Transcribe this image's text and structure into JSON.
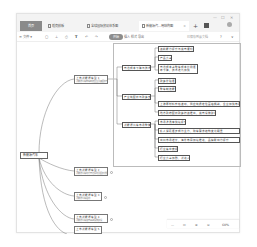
{
  "window": {
    "controls": [
      "—",
      "☐",
      "✕"
    ]
  },
  "tabs": [
    {
      "label": "首页",
      "active": false
    },
    {
      "label": "稻壳模板",
      "active": false
    },
    {
      "label": "全球国际贸易体系图",
      "active": false
    },
    {
      "label": "新能源汽...用结构图",
      "active": true,
      "close": "×"
    }
  ],
  "tab_add": "+",
  "toolbar": {
    "file_menu": "≡ 文件 ▾",
    "icons": [
      "save-icon",
      "upload-icon",
      "print-icon",
      "format-painter-icon",
      "undo-icon",
      "redo-icon"
    ],
    "icon_glyphs": [
      "▢",
      "⊥",
      "⎙",
      "🖌",
      "↶",
      "↷"
    ],
    "badge": "开始",
    "title_hint": "插入 样式 导出",
    "save_status": "已保存到云文档",
    "help": "?",
    "expand": "∨"
  },
  "mindmap": {
    "root": "新能源汽车",
    "level1": [
      {
        "label": "上市新能源车型 1",
        "sub": "新能源汽车整车制造企业及其配套产业链情况"
      },
      {
        "label": "上市新能源车型 2",
        "sub": "新能源汽车动力电池系统及配套发展情况"
      },
      {
        "label": "上市新能源车型 3",
        "sub": "新能源汽车驱动"
      },
      {
        "label": "上市新能源车型 4",
        "sub": "新能源汽车充电基础设施建设"
      },
      {
        "label": "上市新能源车型 5",
        "sub": "新能源汽车售后"
      }
    ],
    "level2": [
      {
        "label": "电池成本下降与技术进步"
      },
      {
        "label": "产业链配套与政策支持"
      },
      {
        "label": "新能源汽车市场整体发展"
      }
    ],
    "level3": [
      {
        "label": "续航能力提升与充电便利性需求"
      },
      {
        "label": "产品竞争力"
      },
      {
        "label": "电池成本占整车成本比例逐年下降，技术迭代加快"
      },
      {
        "label": "政策补贴逐步退坡"
      },
      {
        "label": "整车制造能力提升"
      },
      {
        "label": "上游原材料价格波动，供应链稳定性面临挑战，企业加快布局上游资源"
      },
      {
        "label": "地方政府配套政策持续推出，充电设施建设提速"
      },
      {
        "label": "市场渗透率快速提升，消费认知"
      },
      {
        "label": "私人消费逐步成为主力，购车需求结构变化明显"
      },
      {
        "label": "出口市场增长，海外布局加速推进，品牌影响力提升"
      },
      {
        "label": "行业集中度提升"
      },
      {
        "label": "行业竞争加剧，新进入者不断涌现"
      }
    ]
  },
  "zoombar": {
    "minus": "—",
    "fit": "⊡",
    "zoom_in": "⊕",
    "zoom_out": "⊖",
    "percent": "60%"
  }
}
